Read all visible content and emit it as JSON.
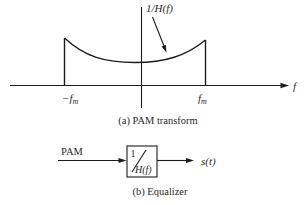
{
  "figure": {
    "part_a": {
      "curve_label": "1/H(f)",
      "axis_label": "f",
      "neg_fm": {
        "main": "−f",
        "sub": "m"
      },
      "pos_fm": {
        "main": "f",
        "sub": "m"
      },
      "caption": "(a) PAM transform"
    },
    "part_b": {
      "input_label": "PAM",
      "block": {
        "numerator": "1",
        "denominator": "H(f)"
      },
      "output_label": "s(t)",
      "caption": "(b) Equalizer"
    }
  },
  "colors": {
    "ink": "#1c1c1c",
    "background": "#ffffff"
  }
}
